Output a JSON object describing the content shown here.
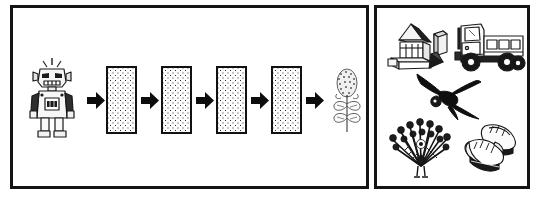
{
  "figure": {
    "title": "",
    "background_color": "#ffffff",
    "line_color": "#141414",
    "panels": [
      {
        "id": "sequence",
        "name": "transformation-sequence-panel",
        "role": "Left panel showing a left-to-right sequence of images connected by block arrows"
      },
      {
        "id": "examples",
        "name": "example-objects-panel",
        "role": "Right panel showing five separate line-drawn objects"
      }
    ]
  },
  "sequence_panel": {
    "label": "",
    "steps": [
      {
        "index": 0,
        "kind": "illustration",
        "name": "robot-figure",
        "label": "robot"
      },
      {
        "index": 1,
        "kind": "arrow",
        "name": "arrow-right",
        "label": "arrow"
      },
      {
        "index": 2,
        "kind": "stipple-box",
        "name": "stippled-box",
        "label": "box 1"
      },
      {
        "index": 3,
        "kind": "arrow",
        "name": "arrow-right",
        "label": "arrow"
      },
      {
        "index": 4,
        "kind": "stipple-box",
        "name": "stippled-box",
        "label": "box 2"
      },
      {
        "index": 5,
        "kind": "arrow",
        "name": "arrow-right",
        "label": "arrow"
      },
      {
        "index": 6,
        "kind": "stipple-box",
        "name": "stippled-box",
        "label": "box 3"
      },
      {
        "index": 7,
        "kind": "arrow",
        "name": "arrow-right",
        "label": "arrow"
      },
      {
        "index": 8,
        "kind": "stipple-box",
        "name": "stippled-box",
        "label": "box 4"
      },
      {
        "index": 9,
        "kind": "arrow",
        "name": "arrow-right",
        "label": "arrow"
      },
      {
        "index": 10,
        "kind": "illustration",
        "name": "plant-figure",
        "label": "plant"
      }
    ],
    "start_item": "robot",
    "end_item": "plant",
    "box_count": 4,
    "arrow_count": 5
  },
  "examples_panel": {
    "items": [
      {
        "name": "building-blocks-icon",
        "label": "building blocks",
        "position": "top-left"
      },
      {
        "name": "dump-truck-icon",
        "label": "dump truck",
        "position": "top-right"
      },
      {
        "name": "bird-icon",
        "label": "bird",
        "position": "middle-center"
      },
      {
        "name": "peacock-icon",
        "label": "peacock",
        "position": "bottom-left"
      },
      {
        "name": "sneakers-icon",
        "label": "sneakers",
        "position": "bottom-right"
      }
    ],
    "item_count": 5
  }
}
